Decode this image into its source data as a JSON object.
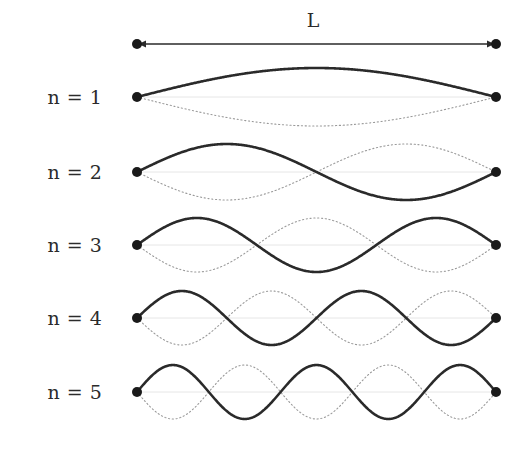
{
  "figure": {
    "width": 532,
    "height": 449,
    "background_color": "#ffffff"
  },
  "dimension": {
    "label": "L",
    "label_x": 313,
    "label_y": 20,
    "arrow_y": 44,
    "arrow_left_x": 137,
    "arrow_right_x": 496,
    "arrow_color": "#2a2a2a",
    "endpoint_dot_color": "#1a1a1a",
    "endpoint_dot_radius": 5
  },
  "style": {
    "solid_curve_color": "#2a2a2a",
    "solid_curve_width": 2.6,
    "dotted_curve_color": "#9a9a9a",
    "dotted_curve_width": 1.1,
    "dotted_dash_pattern": "1.2 2.6",
    "baseline_color": "#e6e6e6",
    "baseline_width": 1,
    "node_dot_color": "#1a1a1a",
    "node_dot_radius": 5,
    "label_color": "#2b2b2b"
  },
  "chart_data": {
    "type": "line",
    "xlabel": "",
    "ylabel": "",
    "x_left": 137,
    "x_right": 496,
    "string_length_px": 359,
    "annotations": [
      {
        "text": "L",
        "x": 313,
        "y": 20,
        "role": "length-dimension"
      }
    ],
    "series": [
      {
        "name": "n = 1",
        "label": "n = 1",
        "harmonic": 1,
        "half_wavelengths": 1,
        "baseline_y": 97,
        "amplitude_px": 29,
        "label_x": 75,
        "label_y": 97,
        "formula": "y = A sin(1 * pi * x / L)"
      },
      {
        "name": "n = 2",
        "label": "n = 2",
        "harmonic": 2,
        "half_wavelengths": 2,
        "baseline_y": 172,
        "amplitude_px": 28,
        "label_x": 75,
        "label_y": 172,
        "formula": "y = A sin(2 * pi * x / L)"
      },
      {
        "name": "n = 3",
        "label": "n = 3",
        "harmonic": 3,
        "half_wavelengths": 3,
        "baseline_y": 245,
        "amplitude_px": 27,
        "label_x": 75,
        "label_y": 245,
        "formula": "y = A sin(3 * pi * x / L)"
      },
      {
        "name": "n = 4",
        "label": "n = 4",
        "harmonic": 4,
        "half_wavelengths": 4,
        "baseline_y": 318,
        "amplitude_px": 27,
        "label_x": 75,
        "label_y": 318,
        "formula": "y = A sin(4 * pi * x / L)"
      },
      {
        "name": "n = 5",
        "label": "n = 5",
        "harmonic": 5,
        "half_wavelengths": 5,
        "baseline_y": 392,
        "amplitude_px": 27,
        "label_x": 75,
        "label_y": 392,
        "formula": "y = A sin(5 * pi * x / L)"
      }
    ],
    "legend": null,
    "grid": false
  }
}
